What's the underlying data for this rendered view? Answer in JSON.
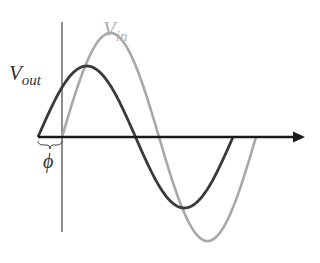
{
  "diagram": {
    "labels": {
      "vin_main": "V",
      "vin_sub": "in",
      "vout_main": "V",
      "vout_sub": "out",
      "phase": "ϕ"
    },
    "colors": {
      "vin": "#a8a8a8",
      "vout": "#3a3a3a",
      "axis": "#1a1a1a",
      "vertical_axis": "#444444",
      "label_vin": "#b0b0b0",
      "label_vout": "#333333",
      "label_phase": "#333333"
    },
    "geometry": {
      "axis_y": 137,
      "axis_x_start": 38,
      "axis_x_end": 305,
      "vertical_x": 62,
      "vertical_y_top": 22,
      "vertical_y_bottom": 232,
      "vin": {
        "x_start": 62,
        "period": 194,
        "amplitude": 104
      },
      "vout": {
        "x_start": 38,
        "period": 195,
        "amplitude": 71
      }
    }
  }
}
